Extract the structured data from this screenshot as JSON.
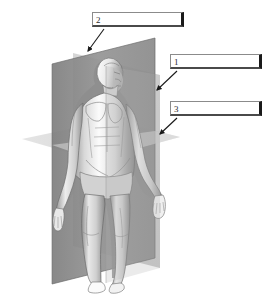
{
  "figure": {
    "background_color": "#ffffff"
  },
  "labels": [
    {
      "id": "label-2",
      "number": "2",
      "answer": "",
      "box": {
        "x": 92,
        "y": 12,
        "width": 92,
        "height": 15
      },
      "arrow": {
        "from_x": 104,
        "from_y": 29,
        "to_x": 88,
        "to_y": 51
      },
      "points_to": "top edge of sagittal plane"
    },
    {
      "id": "label-1",
      "number": "1",
      "answer": "",
      "box": {
        "x": 170,
        "y": 54,
        "width": 92,
        "height": 15
      },
      "arrow": {
        "from_x": 176,
        "from_y": 71,
        "to_x": 156,
        "to_y": 90
      },
      "points_to": "right edge of frontal plane"
    },
    {
      "id": "label-3",
      "number": "3",
      "answer": "",
      "box": {
        "x": 170,
        "y": 101,
        "width": 92,
        "height": 15
      },
      "arrow": {
        "from_x": 176,
        "from_y": 118,
        "to_x": 159,
        "to_y": 134
      },
      "points_to": "transverse plane surface"
    }
  ],
  "planes": {
    "frontal_plane": {
      "name": "frontal-plane",
      "fill": "#8e8e8e",
      "opacity": 0.88
    },
    "sagittal_plane": {
      "name": "sagittal-plane",
      "fill": "#a8a8a8",
      "opacity": 0.55
    },
    "transverse_plane": {
      "name": "transverse-plane",
      "fill": "#cfcfcf",
      "opacity": 0.75
    }
  },
  "body": {
    "name": "male-anatomical-figure",
    "skin_light": "#ffffff",
    "skin_mid": "#c9c9c9",
    "skin_shadow": "#8f8f8f",
    "outline": "#5b5b5b"
  },
  "colors": {
    "box_border": "#8b8b8b",
    "box_shadow_edge": "#1a1a1a",
    "arrow": "#1a1a1a",
    "number_text": "#2b2b2b"
  }
}
